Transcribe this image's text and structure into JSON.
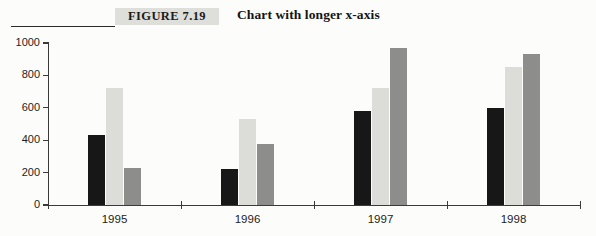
{
  "figure": {
    "number_label": "FIGURE 7.19",
    "caption": "Chart with longer x-axis"
  },
  "chart_data": {
    "type": "bar",
    "title": "Chart with longer x-axis",
    "xlabel": "",
    "ylabel": "",
    "categories": [
      "1995",
      "1996",
      "1997",
      "1998"
    ],
    "yticks": [
      0,
      200,
      400,
      600,
      800,
      1000
    ],
    "ytick_labels": [
      "0",
      "200",
      "400",
      "600",
      "800",
      "1000"
    ],
    "ylim": [
      0,
      1000
    ],
    "grid": false,
    "legend": "none",
    "series": [
      {
        "name": "Series 1",
        "color": "#171717",
        "values": [
          430,
          220,
          580,
          600
        ]
      },
      {
        "name": "Series 2",
        "color": "#dcdcd8",
        "values": [
          720,
          530,
          725,
          855
        ]
      },
      {
        "name": "Series 3",
        "color": "#8d8d8b",
        "values": [
          230,
          375,
          970,
          935
        ]
      }
    ]
  }
}
